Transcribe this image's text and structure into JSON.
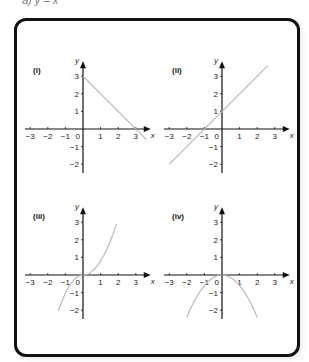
{
  "header": {
    "partial_text": "a) y = x"
  },
  "chart_data": [
    {
      "type": "line",
      "title": "(i)",
      "xlabel": "x",
      "ylabel": "y",
      "xlim": [
        -3,
        3
      ],
      "ylim": [
        -2,
        3
      ],
      "x_ticks": [
        "-3",
        "-2",
        "-1",
        "0",
        "1",
        "2",
        "3"
      ],
      "y_ticks": [
        "3",
        "2",
        "1",
        "-1",
        "-2"
      ],
      "function": "y = -x + 3",
      "x": [
        0,
        3.6
      ],
      "y": [
        3,
        -0.6
      ]
    },
    {
      "type": "line",
      "title": "(ii)",
      "xlabel": "x",
      "ylabel": "y",
      "xlim": [
        -3,
        3
      ],
      "ylim": [
        -2,
        3
      ],
      "x_ticks": [
        "-3",
        "-2",
        "-1",
        "0",
        "1",
        "2",
        "3"
      ],
      "y_ticks": [
        "3",
        "2",
        "1",
        "-1",
        "-2"
      ],
      "function": "y = x + 1",
      "x": [
        -3,
        2.6
      ],
      "y": [
        -2,
        3.6
      ]
    },
    {
      "type": "line",
      "title": "(iii)",
      "xlabel": "x",
      "ylabel": "y",
      "xlim": [
        -3,
        3
      ],
      "ylim": [
        -2,
        3
      ],
      "x_ticks": [
        "-3",
        "-2",
        "-1",
        "0",
        "1",
        "2",
        "3"
      ],
      "y_ticks": [
        "3",
        "2",
        "1",
        "-1",
        "-2"
      ],
      "function": "y = 0.8 x|x| (cubic-like curve)",
      "x": [
        -1.4,
        -1,
        -0.5,
        0,
        0.5,
        1,
        1.5,
        1.9
      ],
      "y": [
        -2.1,
        -1.1,
        -0.25,
        0,
        0.2,
        0.8,
        1.8,
        2.9
      ]
    },
    {
      "type": "line",
      "title": "(iv)",
      "xlabel": "x",
      "ylabel": "y",
      "xlim": [
        -3,
        3
      ],
      "ylim": [
        -2,
        3
      ],
      "x_ticks": [
        "-3",
        "-2",
        "-1",
        "0",
        "1",
        "2",
        "3"
      ],
      "y_ticks": [
        "3",
        "2",
        "1",
        "-1",
        "-2"
      ],
      "function": "y = -0.6 x^2",
      "x": [
        -2,
        -1.5,
        -1,
        -0.5,
        0,
        0.5,
        1,
        1.5,
        2
      ],
      "y": [
        -2.4,
        -1.35,
        -0.6,
        -0.15,
        0,
        -0.15,
        -0.6,
        -1.35,
        -2.4
      ]
    }
  ],
  "panels": [
    {
      "label": "(i)"
    },
    {
      "label": "(ii)"
    },
    {
      "label": "(iii)"
    },
    {
      "label": "(iv)"
    }
  ],
  "axis": {
    "x": "x",
    "y": "y",
    "origin": "0"
  },
  "colors": {
    "curve": "#b8b8b8",
    "axis": "#111111",
    "frame": "#111111"
  }
}
